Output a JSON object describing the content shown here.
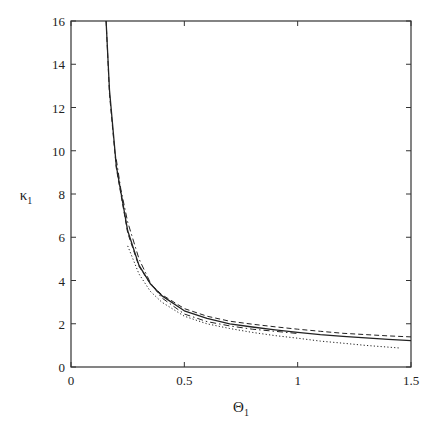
{
  "chart_data": {
    "type": "line",
    "title": "",
    "xlabel": "Θ",
    "xlabel_sub": "1",
    "ylabel": "κ",
    "ylabel_sub": "1",
    "xlim": [
      0,
      1.5
    ],
    "ylim": [
      0,
      16
    ],
    "xticks": [
      0,
      0.5,
      1,
      1.5
    ],
    "xtick_labels": [
      "0",
      "0.5",
      "1",
      "1.5"
    ],
    "yticks": [
      0,
      2,
      4,
      6,
      8,
      10,
      12,
      14,
      16
    ],
    "ytick_labels": [
      "0",
      "2",
      "4",
      "6",
      "8",
      "10",
      "12",
      "14",
      "16"
    ],
    "grid": false,
    "legend": null,
    "series": [
      {
        "name": "solid",
        "style": "solid",
        "x": [
          0.155,
          0.17,
          0.2,
          0.25,
          0.3,
          0.35,
          0.4,
          0.5,
          0.6,
          0.7,
          0.8,
          0.9,
          1.0,
          1.1,
          1.2,
          1.3,
          1.4,
          1.5
        ],
        "y": [
          16.0,
          12.8,
          9.3,
          6.3,
          4.7,
          3.85,
          3.3,
          2.6,
          2.25,
          2.0,
          1.85,
          1.72,
          1.6,
          1.5,
          1.42,
          1.35,
          1.28,
          1.22
        ]
      },
      {
        "name": "dashed",
        "style": "dashed",
        "x": [
          0.155,
          0.17,
          0.2,
          0.25,
          0.3,
          0.35,
          0.4,
          0.5,
          0.6,
          0.7,
          0.8,
          0.9,
          1.0,
          1.1,
          1.2,
          1.3,
          1.4,
          1.5
        ],
        "y": [
          16.0,
          12.6,
          9.2,
          6.2,
          4.65,
          3.85,
          3.35,
          2.7,
          2.35,
          2.12,
          1.98,
          1.86,
          1.75,
          1.65,
          1.56,
          1.5,
          1.44,
          1.39
        ]
      },
      {
        "name": "dash-dot",
        "style": "dashdot",
        "x": [
          0.2,
          0.22,
          0.25,
          0.3,
          0.35,
          0.4,
          0.5,
          0.6,
          0.7,
          0.8,
          0.9,
          1.0
        ],
        "y": [
          9.6,
          8.2,
          6.7,
          5.0,
          3.9,
          3.2,
          2.45,
          2.1,
          1.9,
          1.75,
          1.65,
          1.55
        ]
      },
      {
        "name": "dotted",
        "style": "dotted",
        "x": [
          0.25,
          0.3,
          0.35,
          0.4,
          0.5,
          0.6,
          0.7,
          0.8,
          0.9,
          1.0,
          1.1,
          1.2,
          1.3,
          1.45
        ],
        "y": [
          5.6,
          4.3,
          3.5,
          3.0,
          2.35,
          2.0,
          1.78,
          1.6,
          1.45,
          1.33,
          1.2,
          1.1,
          1.0,
          0.88
        ]
      }
    ]
  }
}
